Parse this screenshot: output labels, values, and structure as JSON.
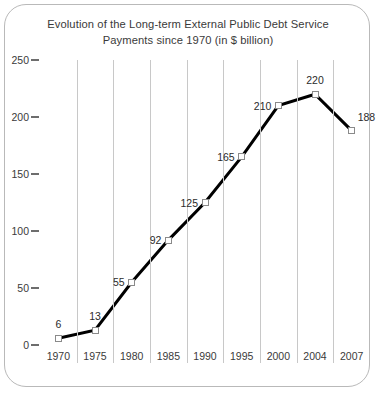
{
  "chart_data": {
    "type": "line",
    "title": "Evolution of the Long-term External Public Debt Service Payments since 1970 (in $ billion)",
    "title_line1": "Evolution of the Long-term External Public Debt Service",
    "title_line2": "Payments since 1970 (in $ billion)",
    "xlabel": "",
    "ylabel": "",
    "categories": [
      "1970",
      "1975",
      "1980",
      "1985",
      "1990",
      "1995",
      "2000",
      "2004",
      "2007"
    ],
    "values": [
      6,
      13,
      55,
      92,
      125,
      165,
      210,
      220,
      188
    ],
    "point_labels": [
      "6",
      "13",
      "55",
      "92",
      "125",
      "165",
      "210",
      "220",
      "188"
    ],
    "label_positions": [
      "above",
      "above",
      "left",
      "left",
      "left",
      "left",
      "left",
      "above",
      "right"
    ],
    "ylim": [
      0,
      250
    ],
    "yticks": [
      0,
      50,
      100,
      150,
      200,
      250
    ],
    "ytick_labels": [
      "0",
      "50",
      "100",
      "150",
      "200",
      "250"
    ],
    "grid": "vertical-category-separators",
    "legend": "none",
    "line_color": "#000000",
    "marker_fill": "#ffffff",
    "marker_stroke": "#8a8a8a",
    "separator_color": "#c8c8c8",
    "border_color": "#b9b9b9",
    "background": "#ffffff"
  }
}
